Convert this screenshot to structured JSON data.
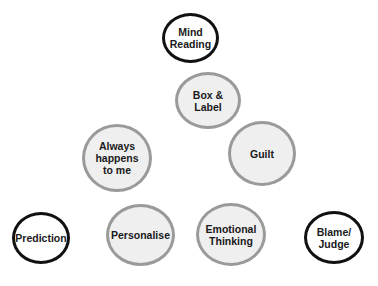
{
  "diagram": {
    "type": "thinking-traps-cluster",
    "nodes": [
      {
        "id": "mind-reading",
        "label": "Mind\nReading",
        "style": "dark",
        "x": 162,
        "y": 13,
        "w": 57,
        "h": 50
      },
      {
        "id": "box-label",
        "label": "Box &\nLabel",
        "style": "light",
        "x": 175,
        "y": 72,
        "w": 66,
        "h": 57
      },
      {
        "id": "always-happens",
        "label": "Always\nhappens\nto me",
        "style": "light",
        "x": 82,
        "y": 124,
        "w": 70,
        "h": 68
      },
      {
        "id": "guilt",
        "label": "Guilt",
        "style": "light",
        "x": 228,
        "y": 121,
        "w": 68,
        "h": 65
      },
      {
        "id": "prediction",
        "label": "Prediction",
        "style": "dark",
        "x": 12,
        "y": 212,
        "w": 58,
        "h": 52
      },
      {
        "id": "personalise",
        "label": "Personalise",
        "style": "light",
        "x": 106,
        "y": 204,
        "w": 69,
        "h": 62
      },
      {
        "id": "emotional-thinking",
        "label": "Emotional\nThinking",
        "style": "light",
        "x": 196,
        "y": 203,
        "w": 70,
        "h": 63
      },
      {
        "id": "blame-judge",
        "label": "Blame/\nJudge",
        "style": "dark",
        "x": 304,
        "y": 211,
        "w": 60,
        "h": 53
      }
    ],
    "colors": {
      "dark_border": "#111111",
      "light_border": "#9a9a9a",
      "light_fill": "#efefef"
    }
  }
}
